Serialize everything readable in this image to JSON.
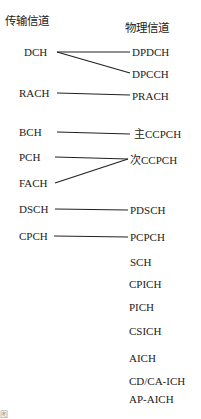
{
  "header": {
    "transport_title": "传输信道",
    "physical_title": "物理信道"
  },
  "transport_channels": [
    "DCH",
    "RACH",
    "BCH",
    "PCH",
    "FACH",
    "DSCH",
    "CPCH"
  ],
  "physical_channels": [
    "DPDCH",
    "DPCCH",
    "PRACH",
    "主CCPCH",
    "次CCPCH",
    "PDSCH",
    "PCPCH",
    "SCH",
    "CPICH",
    "PICH",
    "CSICH",
    "AICH",
    "CD/CA-ICH",
    "AP-AICH"
  ],
  "mappings": [
    {
      "from": "DCH",
      "to": "DPDCH"
    },
    {
      "from": "DCH",
      "to": "DPCCH"
    },
    {
      "from": "RACH",
      "to": "PRACH"
    },
    {
      "from": "BCH",
      "to": "主CCPCH"
    },
    {
      "from": "PCH",
      "to": "次CCPCH"
    },
    {
      "from": "FACH",
      "to": "次CCPCH"
    },
    {
      "from": "DSCH",
      "to": "PDSCH"
    },
    {
      "from": "CPCH",
      "to": "PCPCH"
    }
  ],
  "caption": "图"
}
